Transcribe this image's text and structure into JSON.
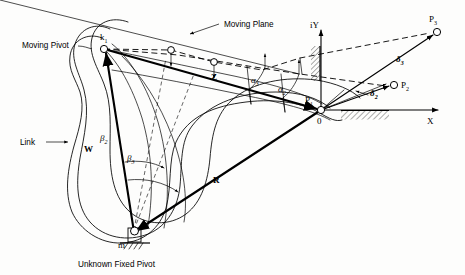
{
  "figure": {
    "background_color": "#fdfdfc",
    "ink_color": "#000000"
  },
  "labels": {
    "moving_pivot": "Moving Pivot",
    "moving_plane": "Moving Plane",
    "link": "Link",
    "unknown_fixed_pivot": "Unknown Fixed Pivot",
    "k1": "k",
    "k1_sub": "1",
    "m": "m",
    "W": "W",
    "Z": "Z",
    "R": "R",
    "origin": "0",
    "axis_x": "X",
    "axis_iy": "iY",
    "P1": "P",
    "P1_sub": "1",
    "P2": "P",
    "P2_sub": "2",
    "P3": "P",
    "P3_sub": "3",
    "alpha2": "α",
    "alpha2_sub": "2",
    "alpha3": "α",
    "alpha3_sub": "3",
    "beta2": "β",
    "beta2_sub": "2",
    "beta3": "β",
    "beta3_sub": "3",
    "delta2": "δ",
    "delta2_sub": "2",
    "delta3": "δ",
    "delta3_sub": "3"
  },
  "geometry": {
    "moving_pivot_k1": {
      "x": 104,
      "y": 49
    },
    "fixed_pivot_m": {
      "x": 134,
      "y": 232
    },
    "origin": {
      "x": 321,
      "y": 110
    },
    "point_P1": {
      "x": 321,
      "y": 110
    },
    "point_P2": {
      "x": 394,
      "y": 85
    },
    "point_P3": {
      "x": 437,
      "y": 32
    },
    "k_position_2": {
      "x": 171,
      "y": 50
    },
    "k_position_3": {
      "x": 214,
      "y": 62
    },
    "x_axis_end": {
      "x": 440,
      "y": 110
    },
    "iy_axis_top": {
      "x": 321,
      "y": 28
    }
  },
  "vectors": [
    {
      "name": "W",
      "from": "fixed pivot m",
      "to": "moving pivot k1"
    },
    {
      "name": "Z",
      "from": "moving pivot k1",
      "to": "P1 / origin"
    },
    {
      "name": "R",
      "from": "fixed pivot m",
      "to": "origin"
    },
    {
      "name": "delta2",
      "from": "origin",
      "to": "P2"
    },
    {
      "name": "delta3",
      "from": "origin",
      "to": "P3"
    }
  ],
  "angles": [
    {
      "name": "alpha2",
      "description": "rotation of Z vector to second position"
    },
    {
      "name": "alpha3",
      "description": "rotation of Z vector to third position"
    },
    {
      "name": "beta2",
      "description": "rotation of W vector to second position"
    },
    {
      "name": "beta3",
      "description": "rotation of W vector to third position"
    }
  ]
}
